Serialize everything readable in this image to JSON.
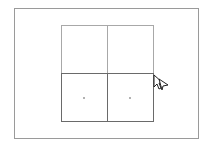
{
  "canvas": {
    "background": "#ffffff",
    "frame_color": "#9a9a9a"
  },
  "grid": {
    "rows": 2,
    "cols": 2,
    "cells": [
      {
        "row": 0,
        "col": 0,
        "border": "#a8a8a8",
        "has_dot": false
      },
      {
        "row": 0,
        "col": 1,
        "border": "#a8a8a8",
        "has_dot": false
      },
      {
        "row": 1,
        "col": 0,
        "border": "#6a6a6a",
        "has_dot": true
      },
      {
        "row": 1,
        "col": 1,
        "border": "#6a6a6a",
        "has_dot": true
      }
    ]
  },
  "cursor": {
    "icon": "move-cursor-icon"
  }
}
